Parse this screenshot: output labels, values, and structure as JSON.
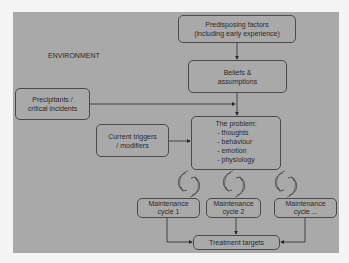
{
  "diagram": {
    "environment_label": "ENVIRONMENT",
    "nodes": {
      "predisposing": {
        "line1": "Predisposing factors",
        "line2": "(including early experience)"
      },
      "beliefs": {
        "line1": "Beliefs &",
        "line2": "assumptions"
      },
      "precipitants": {
        "line1": "Precipitants /",
        "line2": "critical incidents"
      },
      "triggers": {
        "line1": "Current triggers",
        "line2": "/ modifiers"
      },
      "problem": {
        "title": "The problem:",
        "items": [
          "- thoughts",
          "- behaviour",
          "- emotion",
          "- physiology"
        ]
      },
      "cycle1": {
        "line1": "Maintenance",
        "line2": "cycle 1"
      },
      "cycle2": {
        "line1": "Maintenance",
        "line2": "cycle 2"
      },
      "cycle3": {
        "line1": "Maintenance",
        "line2": "cycle ..."
      },
      "treatment": {
        "label": "Treatment targets"
      }
    },
    "edges": [
      {
        "from": "predisposing",
        "to": "beliefs"
      },
      {
        "from": "beliefs",
        "to": "problem"
      },
      {
        "from": "precipitants",
        "to": "problem"
      },
      {
        "from": "triggers",
        "to": "problem"
      },
      {
        "from": "problem",
        "to": "cycle1",
        "style": "circular-arrows"
      },
      {
        "from": "problem",
        "to": "cycle2",
        "style": "circular-arrows"
      },
      {
        "from": "problem",
        "to": "cycle3",
        "style": "circular-arrows"
      },
      {
        "from": "cycle1",
        "to": "treatment"
      },
      {
        "from": "cycle2",
        "to": "treatment"
      },
      {
        "from": "cycle3",
        "to": "treatment"
      }
    ],
    "colors": {
      "panel": "#a9a9a9",
      "border": "#4a4a4a",
      "text": "#2a2a2a",
      "page": "#f4f4f4"
    }
  }
}
